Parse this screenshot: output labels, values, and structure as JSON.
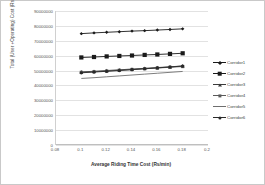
{
  "chart_data": {
    "type": "line",
    "title": "",
    "xlabel": "Average Riding Time Cost (Rs/min)",
    "ylabel": "Total (User +Operating) Cost (Rs/day)",
    "xlim": [
      0.08,
      0.2
    ],
    "ylim": [
      0,
      90000000
    ],
    "grid": true,
    "legend_position": "right",
    "xticks": [
      "0.08",
      "0.1",
      "0.12",
      "0.14",
      "0.16",
      "0.18",
      "0.2"
    ],
    "xtick_values": [
      0.08,
      0.1,
      0.12,
      0.14,
      0.16,
      0.18,
      0.2
    ],
    "yticks": [
      "0",
      "10000000",
      "20000000",
      "30000000",
      "40000000",
      "50000000",
      "60000000",
      "70000000",
      "80000000",
      "90000000"
    ],
    "ytick_values": [
      0,
      10000000,
      20000000,
      30000000,
      40000000,
      50000000,
      60000000,
      70000000,
      80000000,
      90000000
    ],
    "x": [
      0.1,
      0.11,
      0.12,
      0.13,
      0.14,
      0.15,
      0.16,
      0.17,
      0.18
    ],
    "series": [
      {
        "name": "Corridor1",
        "marker": "diamond-small",
        "color": "#1a1a1a",
        "values": [
          74800000,
          75300000,
          75700000,
          76100000,
          76500000,
          76800000,
          77200000,
          77600000,
          78000000
        ]
      },
      {
        "name": "Corridor2",
        "marker": "square-large",
        "color": "#1a1a1a",
        "values": [
          58800000,
          59100000,
          59500000,
          59800000,
          60100000,
          60500000,
          60800000,
          61200000,
          61600000
        ]
      },
      {
        "name": "Corridor3",
        "marker": "triangle-small",
        "color": "#3a3a3a",
        "values": [
          49100000,
          49500000,
          50000000,
          50500000,
          51000000,
          51500000,
          52000000,
          52500000,
          53100000
        ]
      },
      {
        "name": "Corridor4",
        "marker": "cross-small",
        "color": "#5a5a5a",
        "values": [
          48800000,
          49200000,
          49700000,
          50200000,
          50700000,
          51200000,
          51700000,
          52200000,
          52700000
        ]
      },
      {
        "name": "Corridor5",
        "marker": "line-only",
        "color": "#6e6e6e",
        "values": [
          44700000,
          45200000,
          45800000,
          46400000,
          47000000,
          47600000,
          48200000,
          48800000,
          49400000
        ]
      },
      {
        "name": "Corridor6",
        "marker": "dot-small",
        "color": "#2a2a2a",
        "values": [
          48500000,
          49000000,
          49500000,
          50000000,
          50600000,
          51200000,
          51800000,
          52400000,
          53000000
        ]
      }
    ]
  }
}
